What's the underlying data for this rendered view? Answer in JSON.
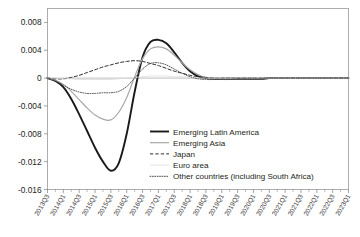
{
  "chart_data": {
    "type": "line",
    "title": "",
    "subtitle": "",
    "xlabel": "",
    "ylabel": "",
    "grid": false,
    "legend_position": "inside-center-right",
    "ylim": [
      -0.016,
      0.01
    ],
    "ytick_labels": [
      "0.008",
      "0.004",
      "0",
      "-0.004",
      "-0.008",
      "-0.012",
      "-0.016"
    ],
    "ytick_values": [
      0.008,
      0.004,
      0,
      -0.004,
      -0.008,
      -0.012,
      -0.016
    ],
    "x": [
      "2013Q3",
      "2013Q4",
      "2014Q1",
      "2014Q2",
      "2014Q3",
      "2014Q4",
      "2015Q1",
      "2015Q2",
      "2015Q3",
      "2015Q4",
      "2016Q1",
      "2016Q2",
      "2016Q3",
      "2016Q4",
      "2017Q1",
      "2017Q2",
      "2017Q3",
      "2017Q4",
      "2018Q1",
      "2018Q2",
      "2018Q3",
      "2018Q4",
      "2019Q1",
      "2019Q2",
      "2019Q3",
      "2019Q4",
      "2020Q1",
      "2020Q2",
      "2020Q3",
      "2020Q4",
      "2021Q1",
      "2021Q2",
      "2021Q3",
      "2021Q4",
      "2022Q1",
      "2022Q2",
      "2022Q3",
      "2022Q4",
      "2023Q1"
    ],
    "xtick_labels": [
      "2013Q3",
      "2014Q1",
      "2014Q3",
      "2015Q1",
      "2015Q3",
      "2016Q1",
      "2016Q3",
      "2017Q1",
      "2017Q3",
      "2018Q1",
      "2018Q3",
      "2019Q1",
      "2019Q3",
      "2020Q1",
      "2020Q3",
      "2021Q1",
      "2021Q3",
      "2022Q1",
      "2022Q3",
      "2023Q1"
    ],
    "xtick_label_indices": [
      0,
      2,
      4,
      6,
      8,
      10,
      12,
      14,
      16,
      18,
      20,
      22,
      24,
      26,
      28,
      30,
      32,
      34,
      36,
      38
    ],
    "series": [
      {
        "name": "Emerging Latin America",
        "style": "solid",
        "color": "#1a1a1a",
        "width": 1.9,
        "values": [
          0.0,
          -0.0004,
          -0.0013,
          -0.003,
          -0.0052,
          -0.0076,
          -0.01,
          -0.012,
          -0.0133,
          -0.0122,
          -0.008,
          -0.002,
          0.003,
          0.0052,
          0.0055,
          0.005,
          0.0037,
          0.0022,
          0.001,
          0.0003,
          0.0,
          -0.0001,
          -0.0001,
          -0.0001,
          -0.0001,
          -0.0001,
          -0.0001,
          -0.0001,
          0.0,
          0.0,
          0.0,
          0.0,
          0.0,
          0.0,
          0.0,
          0.0,
          0.0,
          0.0,
          0.0
        ]
      },
      {
        "name": "Emerging Asia",
        "style": "solid",
        "color": "#a8a8a8",
        "width": 1.2,
        "values": [
          0.0,
          -0.0003,
          -0.0009,
          -0.0019,
          -0.0031,
          -0.0043,
          -0.0053,
          -0.0059,
          -0.006,
          -0.0049,
          -0.0028,
          0.0002,
          0.0028,
          0.0042,
          0.0045,
          0.0042,
          0.0033,
          0.0022,
          0.0012,
          0.0005,
          0.0001,
          0.0,
          0.0,
          0.0,
          0.0,
          0.0,
          0.0,
          0.0,
          0.0,
          0.0,
          0.0,
          0.0,
          0.0,
          0.0,
          0.0,
          0.0,
          0.0,
          0.0,
          0.0
        ]
      },
      {
        "name": "Japan",
        "style": "dashed",
        "color": "#2b2b2b",
        "width": 1.0,
        "values": [
          0.0,
          -0.0001,
          -0.0001,
          0.0001,
          0.0004,
          0.0008,
          0.0012,
          0.0016,
          0.0019,
          0.0022,
          0.0024,
          0.0025,
          0.0024,
          0.0021,
          0.0018,
          0.0014,
          0.001,
          0.0007,
          0.0004,
          0.0002,
          0.0001,
          0.0,
          0.0,
          0.0,
          0.0,
          0.0,
          0.0,
          0.0,
          0.0,
          0.0,
          0.0,
          0.0,
          0.0,
          0.0,
          0.0,
          0.0,
          0.0,
          0.0,
          0.0
        ]
      },
      {
        "name": "Euro area",
        "style": "solid",
        "color": "#dcdcdc",
        "width": 0.8,
        "values": [
          0.0,
          0.0,
          -0.0001,
          -0.0001,
          -0.0002,
          -0.0002,
          -0.0002,
          -0.0002,
          -0.0002,
          -0.0001,
          0.0,
          0.0001,
          0.0002,
          0.0003,
          0.0003,
          0.0003,
          0.0002,
          0.0002,
          0.0001,
          0.0,
          0.0,
          0.0,
          0.0,
          0.0,
          0.0,
          0.0,
          0.0,
          0.0,
          0.0,
          0.0,
          0.0,
          0.0,
          0.0,
          0.0,
          0.0,
          0.0,
          0.0,
          0.0,
          0.0
        ]
      },
      {
        "name": "Other countries (including South Africa)",
        "style": "dotted",
        "color": "#4a4a4a",
        "width": 1.0,
        "values": [
          0.0,
          -0.0004,
          -0.001,
          -0.0016,
          -0.002,
          -0.0022,
          -0.0022,
          -0.0021,
          -0.0021,
          -0.0019,
          -0.0012,
          0.0,
          0.0013,
          0.0021,
          0.0022,
          0.0019,
          0.0013,
          0.0007,
          0.0002,
          -0.0001,
          -0.0002,
          -0.0002,
          -0.0002,
          -0.0002,
          -0.0001,
          -0.0001,
          -0.0001,
          -0.0001,
          0.0,
          0.0,
          0.0,
          0.0,
          0.0,
          0.0,
          0.0,
          0.0,
          0.0,
          0.0,
          0.0
        ]
      }
    ]
  },
  "legend": {
    "entries": [
      {
        "label": "Emerging Latin America"
      },
      {
        "label": "Emerging Asia"
      },
      {
        "label": "Japan"
      },
      {
        "label": "Euro area"
      },
      {
        "label": "Other countries (including South Africa)"
      }
    ]
  }
}
